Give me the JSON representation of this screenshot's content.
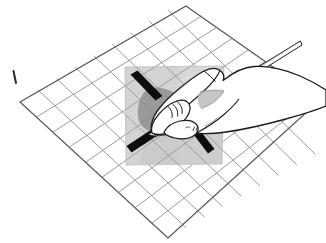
{
  "figure": {
    "title": "Hand holding a stylus over a gridded surface with shaded patch",
    "caption": "",
    "canvas": {
      "width": 326,
      "height": 243,
      "background": "#ffffff"
    },
    "style": "technical line-art illustration, black ink on white",
    "colors": {
      "background": "#ffffff",
      "grid_line": "#8a8a8a",
      "grid_line_dark": "#6f6f6f",
      "outline": "#1a1a1a",
      "patch_fill_light": "#d8d8d8",
      "patch_fill_mid": "#c9c9c9",
      "patch_fill_dark": "#bdbdbd",
      "bar_fill": "#0d0d0d",
      "shadow_fill": "#8d8d8d",
      "hand_fill": "#ffffff",
      "pen_fill": "#ffffff"
    },
    "elements": {
      "grid_label": "perspective grid / graph mesh",
      "patch_label": "shaded square patch",
      "bars_label": "thick black marker strokes",
      "hand_label": "right hand",
      "pen_label": "stylus / pen",
      "shadow_label": "cast shadow under hand",
      "tick_label": "reference tick mark"
    },
    "grid": {
      "rows": 8,
      "cols": 9,
      "corners": {
        "top": [
          186,
          6
        ],
        "right": [
          320,
          100
        ],
        "bottom": [
          168,
          238
        ],
        "left": [
          20,
          102
        ]
      }
    },
    "patch": {
      "corners": [
        [
          125,
          67
        ],
        [
          224,
          66
        ],
        [
          222,
          164
        ],
        [
          126,
          165
        ]
      ],
      "note": "light grey square region highlighted on the grid"
    },
    "bars": [
      {
        "name": "upper-left-bar",
        "from": [
          133,
          77
        ],
        "to": [
          158,
          98
        ],
        "width": 9
      },
      {
        "name": "lower-left-bar",
        "from": [
          131,
          148
        ],
        "to": [
          160,
          128
        ],
        "width": 9
      },
      {
        "name": "lower-right-bar",
        "from": [
          189,
          127
        ],
        "to": [
          212,
          152
        ],
        "width": 9
      }
    ],
    "pen": {
      "tip": [
        150,
        132
      ],
      "tail": [
        303,
        41
      ]
    },
    "tick": {
      "from": [
        13,
        71
      ],
      "to": [
        16,
        83
      ]
    }
  }
}
